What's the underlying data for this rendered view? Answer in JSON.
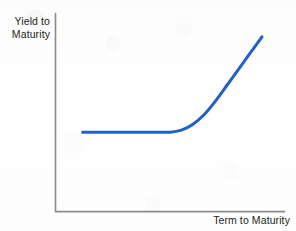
{
  "figure": {
    "name": "yield-curve-diagram",
    "background_color": "#fdfdfd"
  },
  "chart_data": {
    "type": "line",
    "title": "",
    "subtitle": "",
    "xlabel": "Term to Maturity",
    "ylabel": "Yield to Maturity",
    "ylabel_lines": [
      "Yield to",
      "Maturity"
    ],
    "grid": false,
    "legend": null,
    "legend_position": "none",
    "xlim": [
      0,
      1
    ],
    "ylim": [
      0,
      1
    ],
    "x_tick_labels": [],
    "y_tick_labels": [],
    "annotations": [],
    "series": [
      {
        "name": "Normal (upward-sloping) yield curve",
        "color": "#2060c8",
        "line_width": 3,
        "x": [
          0.12,
          0.2,
          0.3,
          0.4,
          0.5,
          0.55,
          0.6,
          0.65,
          0.7,
          0.75,
          0.8,
          0.85,
          0.9
        ],
        "y": [
          0.4,
          0.4,
          0.4,
          0.4,
          0.4,
          0.41,
          0.44,
          0.49,
          0.56,
          0.64,
          0.72,
          0.8,
          0.88
        ]
      }
    ]
  },
  "axes": {
    "color": "#8a8a8a",
    "y_axis_name": "y-axis-line",
    "x_axis_name": "x-axis-line"
  },
  "colors": {
    "curve": "#2060c8",
    "axis": "#8a8a8a",
    "text": "#231f20",
    "background": "#fdfdfd"
  }
}
